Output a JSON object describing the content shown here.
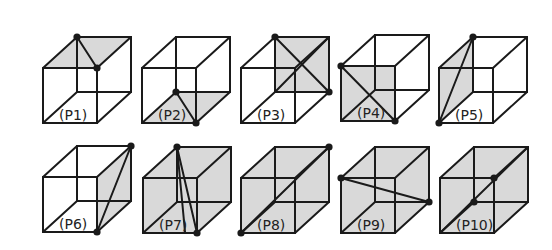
{
  "figure": {
    "width": 552,
    "height": 250,
    "shade_color": "#d9d9d9",
    "line_color": "#1a1a1a",
    "cube": {
      "w": 54,
      "h": 55,
      "dx": 34,
      "dy": -31
    },
    "cubes": [
      {
        "id": "P1",
        "label": "(P1)",
        "x": 43,
        "y": 68,
        "fill": "top",
        "cuts": [
          [
            "BTL",
            "FTR"
          ]
        ],
        "dots": [
          "BTL",
          "FTR"
        ]
      },
      {
        "id": "P2",
        "label": "(P2)",
        "x": 142,
        "y": 68,
        "fill": "bottom",
        "cuts": [
          [
            "BBL",
            "FBR"
          ]
        ],
        "dots": [
          "BBL",
          "FBR"
        ]
      },
      {
        "id": "P3",
        "label": "(P3)",
        "x": 241,
        "y": 68,
        "fill": "back",
        "cuts": [
          [
            "BTL",
            "BBR"
          ],
          [
            "BTR",
            "BBL"
          ]
        ],
        "dots": [
          "BTL",
          "BBR"
        ]
      },
      {
        "id": "P4",
        "label": "(P4)",
        "x": 341,
        "y": 66,
        "fill": "front",
        "cuts": [
          [
            "FTL",
            "FBR"
          ]
        ],
        "dots": [
          "FTL",
          "FBR"
        ]
      },
      {
        "id": "P5",
        "label": "(P5)",
        "x": 439,
        "y": 68,
        "fill": "left",
        "cuts": [
          [
            "BTL",
            "FBL"
          ]
        ],
        "dots": [
          "BTL",
          "FBL"
        ]
      },
      {
        "id": "P6",
        "label": "(P6)",
        "x": 43,
        "y": 177,
        "fill": "right",
        "cuts": [
          [
            "BTR",
            "FBR"
          ]
        ],
        "dots": [
          "BTR",
          "FBR"
        ]
      },
      {
        "id": "P7",
        "label": "(P7)",
        "x": 143,
        "y": 178,
        "fill": "all",
        "cuts": [
          [
            "BTL",
            "FBR"
          ],
          [
            "BTL",
            "FBM"
          ]
        ],
        "dots": [
          "BTL",
          "FBR"
        ]
      },
      {
        "id": "P8",
        "label": "(P8)",
        "x": 241,
        "y": 178,
        "fill": "all",
        "cuts": [
          [
            "FBL",
            "BTR"
          ]
        ],
        "dots": [
          "FBL",
          "BTR"
        ]
      },
      {
        "id": "P9",
        "label": "(P9)",
        "x": 341,
        "y": 178,
        "fill": "all",
        "cuts": [
          [
            "FTL",
            "BBR"
          ]
        ],
        "dots": [
          "FTL",
          "BBR"
        ]
      },
      {
        "id": "P10",
        "label": "(P10)",
        "x": 440,
        "y": 178,
        "fill": "all",
        "cuts": [
          [
            "FBL",
            "BTR"
          ]
        ],
        "dots": [
          "BBL",
          "FTR"
        ]
      }
    ]
  }
}
